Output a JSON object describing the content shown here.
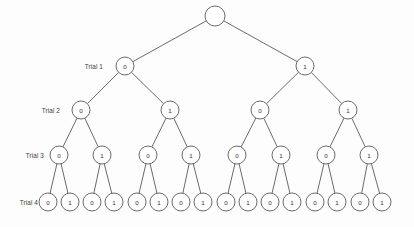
{
  "diagram": {
    "background_color": "#fdfdfd",
    "stroke_color": "#5a5a5a",
    "node_fill": "#ffffff",
    "node_radius": 9,
    "root_radius": 10
  },
  "row_labels": [
    {
      "text": "Trial 1",
      "x": 103,
      "y": 66
    },
    {
      "text": "Trial 2",
      "x": 60,
      "y": 110
    },
    {
      "text": "Trial 3",
      "x": 44,
      "y": 155
    },
    {
      "text": "Trial 4",
      "x": 38,
      "y": 202
    }
  ],
  "levels": [
    {
      "index": 0,
      "label": "",
      "y": 16,
      "nodes": [
        {
          "id": "root",
          "label": "",
          "x": 215,
          "y": 16,
          "r": 10
        }
      ]
    },
    {
      "index": 1,
      "label": "Trial 1",
      "y": 66,
      "nodes": [
        {
          "id": "n0",
          "label": "0",
          "x": 125,
          "y": 66,
          "r": 9,
          "parent": "root"
        },
        {
          "id": "n1",
          "label": "1",
          "x": 305,
          "y": 66,
          "r": 9,
          "parent": "root"
        }
      ]
    },
    {
      "index": 2,
      "label": "Trial 2",
      "y": 110,
      "nodes": [
        {
          "id": "n00",
          "label": "0",
          "x": 81,
          "y": 110,
          "r": 9,
          "parent": "n0"
        },
        {
          "id": "n01",
          "label": "1",
          "x": 170,
          "y": 110,
          "r": 9,
          "parent": "n0"
        },
        {
          "id": "n10",
          "label": "0",
          "x": 260,
          "y": 110,
          "r": 9,
          "parent": "n1"
        },
        {
          "id": "n11",
          "label": "1",
          "x": 348,
          "y": 110,
          "r": 9,
          "parent": "n1"
        }
      ]
    },
    {
      "index": 3,
      "label": "Trial 3",
      "y": 155,
      "nodes": [
        {
          "id": "n000",
          "label": "0",
          "x": 59,
          "y": 155,
          "r": 9,
          "parent": "n00"
        },
        {
          "id": "n001",
          "label": "1",
          "x": 102,
          "y": 155,
          "r": 9,
          "parent": "n00"
        },
        {
          "id": "n010",
          "label": "0",
          "x": 148,
          "y": 155,
          "r": 9,
          "parent": "n01"
        },
        {
          "id": "n011",
          "label": "1",
          "x": 191,
          "y": 155,
          "r": 9,
          "parent": "n01"
        },
        {
          "id": "n100",
          "label": "0",
          "x": 237,
          "y": 155,
          "r": 9,
          "parent": "n10"
        },
        {
          "id": "n101",
          "label": "1",
          "x": 281,
          "y": 155,
          "r": 9,
          "parent": "n10"
        },
        {
          "id": "n110",
          "label": "0",
          "x": 326,
          "y": 155,
          "r": 9,
          "parent": "n11"
        },
        {
          "id": "n111",
          "label": "1",
          "x": 369,
          "y": 155,
          "r": 9,
          "parent": "n11"
        }
      ]
    },
    {
      "index": 4,
      "label": "Trial 4",
      "y": 202,
      "nodes": [
        {
          "id": "n0000",
          "label": "0",
          "x": 48,
          "y": 202,
          "r": 9,
          "parent": "n000"
        },
        {
          "id": "n0001",
          "label": "1",
          "x": 70,
          "y": 202,
          "r": 9,
          "parent": "n000"
        },
        {
          "id": "n0010",
          "label": "0",
          "x": 92,
          "y": 202,
          "r": 9,
          "parent": "n001"
        },
        {
          "id": "n0011",
          "label": "1",
          "x": 114,
          "y": 202,
          "r": 9,
          "parent": "n001"
        },
        {
          "id": "n0100",
          "label": "0",
          "x": 137,
          "y": 202,
          "r": 9,
          "parent": "n010"
        },
        {
          "id": "n0101",
          "label": "1",
          "x": 159,
          "y": 202,
          "r": 9,
          "parent": "n010"
        },
        {
          "id": "n0110",
          "label": "0",
          "x": 181,
          "y": 202,
          "r": 9,
          "parent": "n011"
        },
        {
          "id": "n0111",
          "label": "1",
          "x": 203,
          "y": 202,
          "r": 9,
          "parent": "n011"
        },
        {
          "id": "n1000",
          "label": "0",
          "x": 226,
          "y": 202,
          "r": 9,
          "parent": "n100"
        },
        {
          "id": "n1001",
          "label": "1",
          "x": 248,
          "y": 202,
          "r": 9,
          "parent": "n100"
        },
        {
          "id": "n1010",
          "label": "0",
          "x": 270,
          "y": 202,
          "r": 9,
          "parent": "n101"
        },
        {
          "id": "n1011",
          "label": "1",
          "x": 292,
          "y": 202,
          "r": 9,
          "parent": "n101"
        },
        {
          "id": "n1100",
          "label": "0",
          "x": 315,
          "y": 202,
          "r": 9,
          "parent": "n110"
        },
        {
          "id": "n1101",
          "label": "1",
          "x": 337,
          "y": 202,
          "r": 9,
          "parent": "n110"
        },
        {
          "id": "n1110",
          "label": "0",
          "x": 360,
          "y": 202,
          "r": 9,
          "parent": "n111"
        },
        {
          "id": "n1111",
          "label": "1",
          "x": 382,
          "y": 202,
          "r": 9,
          "parent": "n111"
        }
      ]
    }
  ]
}
